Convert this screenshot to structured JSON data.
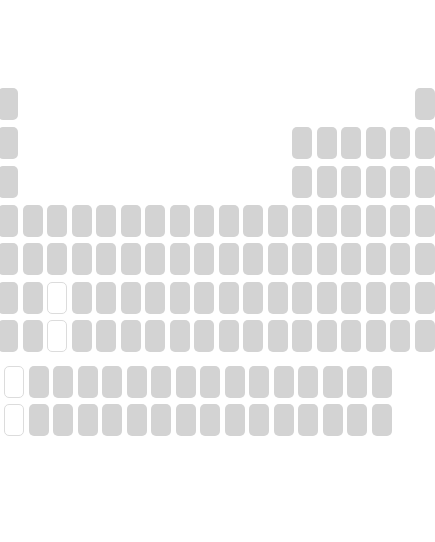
{
  "colors": {
    "tile": "#d3d3d3",
    "placeholder_border": "#dcdcdc",
    "background": "#ffffff"
  },
  "layout": {
    "col_x": [
      -2,
      25,
      50,
      74,
      99,
      123,
      148,
      172,
      197,
      221,
      246,
      270,
      295,
      319,
      344,
      368,
      392,
      392
    ],
    "row_y": [
      88,
      127,
      166,
      205,
      243,
      282,
      320
    ],
    "f_rows_y": [
      366,
      404
    ],
    "f_col_start_x": 4,
    "f_pitch": 24.5
  },
  "rows": [
    {
      "period": 1,
      "cells": [
        {
          "col": 1
        },
        {
          "col": 18
        }
      ]
    },
    {
      "period": 2,
      "cells": [
        {
          "col": 1
        },
        {
          "col": 13
        },
        {
          "col": 14
        },
        {
          "col": 15
        },
        {
          "col": 16
        },
        {
          "col": 17
        },
        {
          "col": 18
        }
      ]
    },
    {
      "period": 3,
      "cells": [
        {
          "col": 1
        },
        {
          "col": 13
        },
        {
          "col": 14
        },
        {
          "col": 15
        },
        {
          "col": 16
        },
        {
          "col": 17
        },
        {
          "col": 18
        }
      ]
    },
    {
      "period": 4,
      "cells": "all"
    },
    {
      "period": 5,
      "cells": "all"
    },
    {
      "period": 6,
      "cells": "all",
      "placeholder_cols": [
        3
      ]
    },
    {
      "period": 7,
      "cells": "all",
      "placeholder_cols": [
        3
      ]
    }
  ],
  "f_block": [
    {
      "series": "lanthanides",
      "count": 16,
      "placeholder_index": [
        0
      ]
    },
    {
      "series": "actinides",
      "count": 16,
      "placeholder_index": [
        0
      ]
    }
  ]
}
